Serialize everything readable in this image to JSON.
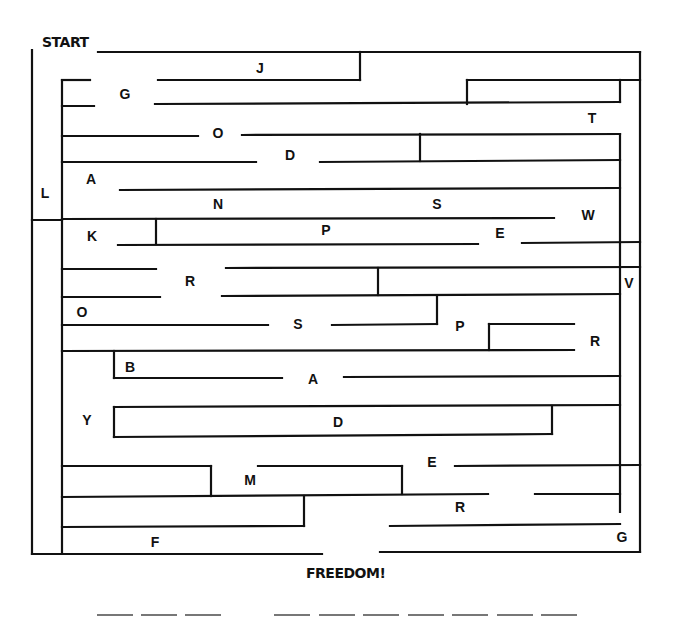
{
  "maze": {
    "start_label": "START",
    "finish_label": "FREEDOM!",
    "letters": [
      {
        "char": "J",
        "x": 260,
        "y": 68
      },
      {
        "char": "G",
        "x": 125,
        "y": 94
      },
      {
        "char": "T",
        "x": 592,
        "y": 118
      },
      {
        "char": "O",
        "x": 218,
        "y": 133
      },
      {
        "char": "D",
        "x": 290,
        "y": 155
      },
      {
        "char": "A",
        "x": 91,
        "y": 179
      },
      {
        "char": "L",
        "x": 45,
        "y": 193
      },
      {
        "char": "N",
        "x": 218,
        "y": 204
      },
      {
        "char": "S",
        "x": 437,
        "y": 204
      },
      {
        "char": "W",
        "x": 588,
        "y": 215
      },
      {
        "char": "K",
        "x": 92,
        "y": 236
      },
      {
        "char": "P",
        "x": 326,
        "y": 230
      },
      {
        "char": "E",
        "x": 500,
        "y": 233
      },
      {
        "char": "R",
        "x": 190,
        "y": 281
      },
      {
        "char": "V",
        "x": 629,
        "y": 283
      },
      {
        "char": "O",
        "x": 82,
        "y": 312
      },
      {
        "char": "S",
        "x": 298,
        "y": 324
      },
      {
        "char": "P",
        "x": 460,
        "y": 326
      },
      {
        "char": "R",
        "x": 595,
        "y": 341
      },
      {
        "char": "B",
        "x": 130,
        "y": 367
      },
      {
        "char": "A",
        "x": 313,
        "y": 379
      },
      {
        "char": "Y",
        "x": 87,
        "y": 420
      },
      {
        "char": "D",
        "x": 338,
        "y": 422
      },
      {
        "char": "E",
        "x": 432,
        "y": 462
      },
      {
        "char": "M",
        "x": 250,
        "y": 480
      },
      {
        "char": "R",
        "x": 460,
        "y": 507
      },
      {
        "char": "F",
        "x": 155,
        "y": 542
      },
      {
        "char": "G",
        "x": 622,
        "y": 537
      }
    ],
    "answer_blanks": {
      "word1_count": 3,
      "word2_count": 7
    }
  },
  "colors": {
    "wall": "#111111",
    "background": "#ffffff",
    "blank_line": "#777777"
  }
}
